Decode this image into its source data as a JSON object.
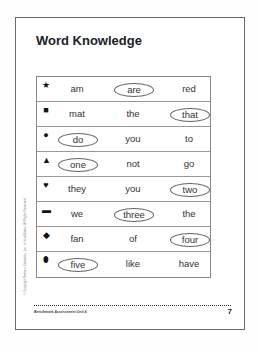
{
  "page": {
    "title": "Word Knowledge",
    "copyright": "© Copyright Pearson Education, Inc., or its affiliates. All Rights Reserved.",
    "footer": "Benchmark Assessment  Unit 4",
    "page_number": "7"
  },
  "rows": [
    {
      "icon": "star-icon",
      "glyph": "★",
      "words": [
        "am",
        "are",
        "red"
      ],
      "circled": 1
    },
    {
      "icon": "square-icon",
      "glyph": "■",
      "words": [
        "mat",
        "the",
        "that"
      ],
      "circled": 2
    },
    {
      "icon": "circle-icon",
      "glyph": "●",
      "words": [
        "do",
        "you",
        "to"
      ],
      "circled": 0
    },
    {
      "icon": "triangle-icon",
      "glyph": "▲",
      "words": [
        "one",
        "not",
        "go"
      ],
      "circled": 0
    },
    {
      "icon": "heart-icon",
      "glyph": "♥",
      "words": [
        "they",
        "you",
        "two"
      ],
      "circled": 2
    },
    {
      "icon": "rectangle-icon",
      "glyph": "▬",
      "words": [
        "we",
        "three",
        "the"
      ],
      "circled": 1
    },
    {
      "icon": "diamond-icon",
      "glyph": "◆",
      "words": [
        "fan",
        "of",
        "four"
      ],
      "circled": 2
    },
    {
      "icon": "oval-icon",
      "glyph": "⬮",
      "words": [
        "five",
        "like",
        "have"
      ],
      "circled": 0
    }
  ]
}
